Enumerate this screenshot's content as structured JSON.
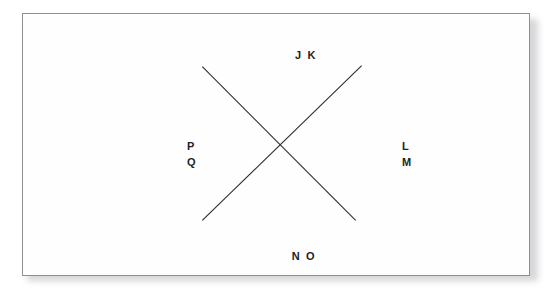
{
  "figure": {
    "background_color": "#ffffff",
    "panel_color": "#fefefe",
    "border_color": "#8d8d93",
    "line_color": "#2b2b2b",
    "label_color": "#221f20",
    "labels": {
      "top": "J K",
      "bottom": "N O",
      "left_upper": "P",
      "left_lower": "Q",
      "right_upper": "L",
      "right_lower": "M"
    },
    "lines": [
      {
        "name": "line-top-left-to-bottom-right",
        "x1": 203,
        "y1": 67,
        "x2": 357,
        "y2": 222
      },
      {
        "name": "line-top-right-to-bottom-left",
        "x1": 363,
        "y1": 66,
        "x2": 203,
        "y2": 222
      }
    ],
    "intersection": {
      "x": 283,
      "y": 145
    }
  }
}
